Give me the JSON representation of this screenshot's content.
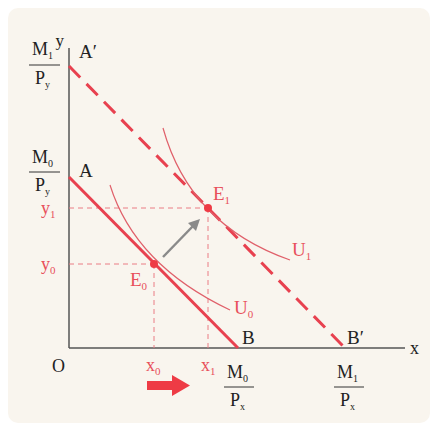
{
  "diagram": {
    "colors": {
      "background": "#f9f5ee",
      "axis": "#555555",
      "budget_line": "#e8414f",
      "indifference_curve": "#e0606a",
      "guide_dashed": "#ea7c84",
      "arrow_gray": "#8a8a8a",
      "arrow_red": "#ee3b45",
      "label_red": "#e8505b",
      "label_black": "#222222"
    },
    "axes": {
      "x_label": "x",
      "y_label": "y",
      "origin_label": "O"
    },
    "points": {
      "A": "A",
      "A_prime": "A′",
      "B": "B",
      "B_prime": "B′",
      "E0": {
        "main": "E",
        "sub": "0"
      },
      "E1": {
        "main": "E",
        "sub": "1"
      }
    },
    "curves": {
      "U0": {
        "main": "U",
        "sub": "0"
      },
      "U1": {
        "main": "U",
        "sub": "1"
      }
    },
    "y_ticks": {
      "y0": {
        "main": "y",
        "sub": "0"
      },
      "y1": {
        "main": "y",
        "sub": "1"
      },
      "M0_Py": {
        "num": "M",
        "num_sub": "0",
        "den": "P",
        "den_sub": "y"
      },
      "M1_Py": {
        "num": "M",
        "num_sub": "1",
        "den": "P",
        "den_sub": "y"
      }
    },
    "x_ticks": {
      "x0": {
        "main": "x",
        "sub": "0"
      },
      "x1": {
        "main": "x",
        "sub": "1"
      },
      "M0_Px": {
        "num": "M",
        "num_sub": "0",
        "den": "P",
        "den_sub": "x"
      },
      "M1_Px": {
        "num": "M",
        "num_sub": "1",
        "den": "P",
        "den_sub": "x"
      }
    },
    "lines": {
      "budget_AB": "solid",
      "budget_A_prime_B_prime": "dashed"
    }
  }
}
